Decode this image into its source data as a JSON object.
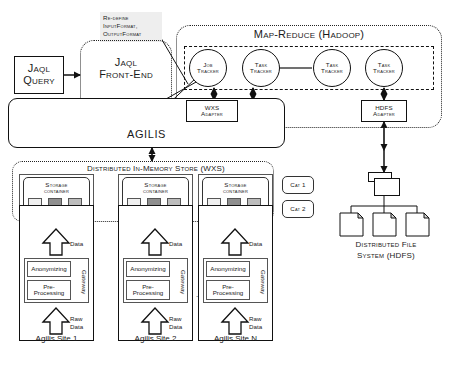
{
  "diagram": {
    "annotation": {
      "line1": "Re-define",
      "line2": "InputFormat,",
      "line3": "OutputFormat"
    },
    "jaql_query": {
      "line1": "Jaql",
      "line2": "Query"
    },
    "jaql_frontend": {
      "line1": "Jaql",
      "line2": "Front-End"
    },
    "query_scheduler": {
      "line1": "Query",
      "line2": "Scheduler"
    },
    "wxs_adapter": {
      "line1": "WXS",
      "line2": "Adapter"
    },
    "hdfs_adapter": {
      "line1": "HDFS",
      "line2": "Adapter"
    },
    "agilis_label": "AGILIS",
    "mapreduce": {
      "title": "Map-Reduce (Hadoop)",
      "nodes": [
        {
          "line1": "Job",
          "line2": "Tracker"
        },
        {
          "line1": "Task",
          "line2": "Tracker"
        },
        {
          "line1": "Task",
          "line2": "Tracker"
        },
        {
          "line1": "Task",
          "line2": "Tracker"
        }
      ]
    },
    "wxs_store": {
      "title": "Distributed In-Memory Store (WXS)",
      "containers": [
        {
          "line1": "Storage",
          "line2": "container"
        },
        {
          "line1": "Storage",
          "line2": "container"
        },
        {
          "line1": "Storage",
          "line2": "container"
        }
      ],
      "categories": [
        "Cat 1",
        "Cat 2"
      ]
    },
    "hdfs": {
      "line1": "Distributed File",
      "line2": "System (HDFS)"
    },
    "sites": [
      {
        "data_label": "Data",
        "anonymizing": "Anonymizing",
        "preprocessing": "Pre-Processing",
        "gateway": "Gateway",
        "raw_line1": "Raw",
        "raw_line2": "Data",
        "name": "Agilis Site 1"
      },
      {
        "data_label": "Data",
        "anonymizing": "Anonymizing",
        "preprocessing": "Pre-Processing",
        "gateway": "Gateway",
        "raw_line1": "Raw",
        "raw_line2": "Data",
        "name": "Agilis Site 2"
      },
      {
        "data_label": "Data",
        "anonymizing": "Anonymizing",
        "preprocessing": "Pre-Processing",
        "gateway": "Gateway",
        "raw_line1": "Raw",
        "raw_line2": "Data",
        "name": "Agilis Site N"
      }
    ],
    "ellipsis": "...",
    "colors": {
      "line": "#111111",
      "background": "#ffffff",
      "shade": "#ededed",
      "cell_light": "#f0f0f0",
      "cell_dark": "#8f8f8f",
      "cell_mid": "#bdbdbd"
    }
  }
}
